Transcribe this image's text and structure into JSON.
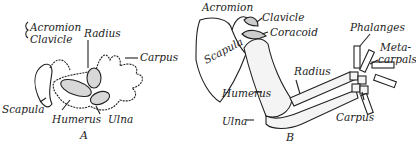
{
  "figure": {
    "panels": [
      {
        "id": "A",
        "label": "A",
        "labels": {
          "acromion": "Acromion",
          "clavicle": "Clavicle",
          "radius": "Radius",
          "carpus": "Carpus",
          "scapula": "Scapula",
          "humerus": "Humerus",
          "ulna": "Ulna"
        }
      },
      {
        "id": "B",
        "label": "B",
        "labels": {
          "acromion": "Acromion",
          "clavicle": "Clavicle",
          "coracoid": "Coracoid",
          "phalanges": "Phalanges",
          "metacarpals_1": "Meta-",
          "metacarpals_2": "carpals",
          "scapula": "Scapula",
          "radius": "Radius",
          "humerus": "Humerus",
          "ulna": "Ulna",
          "carpus": "Carpus"
        }
      }
    ],
    "colors": {
      "ink": "#222222",
      "shade": "#bbbbbb",
      "background": "#ffffff"
    }
  }
}
